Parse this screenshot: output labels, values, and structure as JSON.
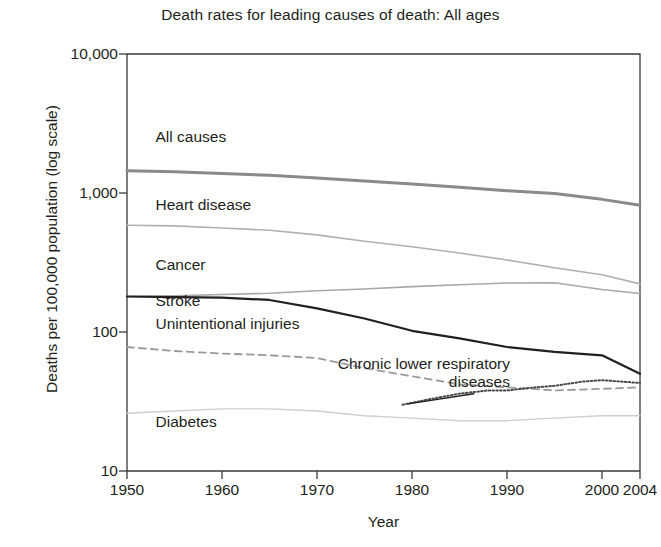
{
  "chart_data": {
    "type": "line",
    "title": "Death rates for leading causes of death: All ages",
    "xlabel": "Year",
    "ylabel": "Deaths per 100,000 population (log scale)",
    "scale": "log",
    "grid": false,
    "legend_position": "inline-labels",
    "xlim": [
      1950,
      2004
    ],
    "ylim": [
      10,
      10000
    ],
    "yticks": [
      10,
      100,
      1000,
      10000
    ],
    "ytick_labels": [
      "10",
      "100",
      "1,000",
      "10,000"
    ],
    "xticks": [
      1950,
      1960,
      1970,
      1980,
      1990,
      2000,
      2004
    ],
    "xtick_labels": [
      "1950",
      "1960",
      "1970",
      "1980",
      "1990",
      "2000",
      "2004"
    ],
    "series": [
      {
        "name": "All causes",
        "style": "solid",
        "color": "#8a8a8a",
        "width": 3.0,
        "label_x": 1953,
        "label_y": 2500,
        "x": [
          1950,
          1955,
          1960,
          1965,
          1970,
          1975,
          1980,
          1985,
          1990,
          1995,
          2000,
          2004
        ],
        "values": [
          1446,
          1420,
          1380,
          1340,
          1280,
          1220,
          1160,
          1100,
          1040,
          990,
          900,
          816
        ]
      },
      {
        "name": "Heart disease",
        "style": "solid",
        "color": "#b0b0b0",
        "width": 1.6,
        "label_x": 1953,
        "label_y": 810,
        "x": [
          1950,
          1955,
          1960,
          1965,
          1970,
          1975,
          1980,
          1985,
          1990,
          1995,
          2000,
          2004
        ],
        "values": [
          586,
          580,
          560,
          540,
          500,
          450,
          410,
          370,
          330,
          290,
          258,
          222
        ]
      },
      {
        "name": "Cancer",
        "style": "solid",
        "color": "#a8a8a8",
        "width": 1.6,
        "label_x": 1953,
        "label_y": 300,
        "x": [
          1950,
          1955,
          1960,
          1965,
          1970,
          1975,
          1980,
          1985,
          1990,
          1995,
          2000,
          2004
        ],
        "values": [
          180,
          182,
          186,
          190,
          198,
          204,
          212,
          219,
          225,
          226,
          202,
          189
        ]
      },
      {
        "name": "Stroke",
        "style": "solid",
        "color": "#231f20",
        "width": 2.2,
        "label_x": 1953,
        "label_y": 165,
        "x": [
          1950,
          1955,
          1960,
          1965,
          1970,
          1975,
          1980,
          1985,
          1990,
          1995,
          2000,
          2004
        ],
        "values": [
          180,
          178,
          177,
          170,
          148,
          125,
          102,
          90,
          78,
          72,
          68,
          50
        ]
      },
      {
        "name": "Unintentional injuries",
        "style": "dashed",
        "color": "#9a9a9a",
        "width": 1.8,
        "label_x": 1953,
        "label_y": 112,
        "x": [
          1950,
          1955,
          1960,
          1965,
          1970,
          1975,
          1980,
          1985,
          1990,
          1995,
          2000,
          2004
        ],
        "values": [
          78,
          73,
          70,
          68,
          65,
          55,
          48,
          42,
          40,
          38,
          39,
          40
        ]
      },
      {
        "name": "Chronic lower respiratory diseases",
        "style": "dotted",
        "color": "#4a4a4a",
        "width": 2.0,
        "label_x": 1988,
        "label_y": 58,
        "x": [
          1979,
          1982,
          1985,
          1988,
          1990,
          1993,
          1995,
          1998,
          2000,
          2002,
          2004
        ],
        "values": [
          30,
          33,
          36,
          38,
          38,
          40,
          41,
          44,
          45,
          44,
          43
        ]
      },
      {
        "name": "Diabetes",
        "style": "solid",
        "color": "#cfcfcf",
        "width": 1.4,
        "label_x": 1953,
        "label_y": 22,
        "x": [
          1950,
          1955,
          1960,
          1965,
          1970,
          1975,
          1980,
          1985,
          1990,
          1995,
          2000,
          2004
        ],
        "values": [
          26,
          27,
          28,
          28,
          27,
          25,
          24,
          23,
          23,
          24,
          25,
          25
        ]
      }
    ],
    "annotations": [
      {
        "text": "Chronic lower respiratory diseases",
        "target_series": "Chronic lower respiratory diseases",
        "leader": true
      }
    ]
  }
}
